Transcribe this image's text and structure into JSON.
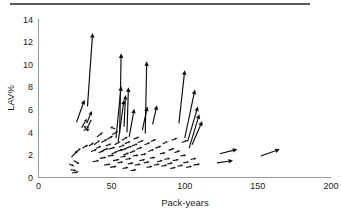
{
  "figure": {
    "background_color": "#ffffff",
    "ink_color": "#0d0d0d",
    "axis_color": "#9a9a9a",
    "top_rule_color": "#5a5a5a"
  },
  "axes": {
    "x_title": "Pack-years",
    "y_title": "LAV%",
    "x_ticks": [
      "0",
      "50",
      "100",
      "150",
      "200"
    ],
    "y_ticks": [
      "0",
      "2",
      "4",
      "6",
      "8",
      "10",
      "12",
      "14"
    ]
  },
  "chart_data": {
    "type": "scatter",
    "title": "",
    "xlabel": "Pack-years",
    "ylabel": "LAV%",
    "xlim": [
      0,
      200
    ],
    "ylim": [
      0,
      14
    ],
    "xticks": [
      0,
      50,
      100,
      150,
      200
    ],
    "yticks": [
      0,
      2,
      4,
      6,
      8,
      10,
      12,
      14
    ],
    "grid": false,
    "legend": "none",
    "marker": "arrow",
    "series": [
      {
        "name": "change-vectors",
        "units": {
          "x": "pack-years",
          "y": "LAV%"
        },
        "vectors": [
          {
            "x0": 21.0,
            "y0": 1.2,
            "x1": 24.5,
            "y1": 1.0
          },
          {
            "x0": 22.0,
            "y0": 0.7,
            "x1": 26.0,
            "y1": 0.6
          },
          {
            "x0": 23.0,
            "y0": 0.4,
            "x1": 27.5,
            "y1": 0.5
          },
          {
            "x0": 24.0,
            "y0": 1.5,
            "x1": 28.0,
            "y1": 1.2
          },
          {
            "x0": 22.5,
            "y0": 1.8,
            "x1": 27.0,
            "y1": 2.4
          },
          {
            "x0": 25.0,
            "y0": 2.2,
            "x1": 29.0,
            "y1": 2.6
          },
          {
            "x0": 26.0,
            "y0": 4.9,
            "x1": 31.5,
            "y1": 6.9
          },
          {
            "x0": 30.0,
            "y0": 2.6,
            "x1": 34.0,
            "y1": 2.9
          },
          {
            "x0": 29.5,
            "y0": 4.4,
            "x1": 33.0,
            "y1": 5.2
          },
          {
            "x0": 31.0,
            "y0": 4.2,
            "x1": 35.0,
            "y1": 4.3
          },
          {
            "x0": 33.0,
            "y0": 4.8,
            "x1": 36.5,
            "y1": 5.9
          },
          {
            "x0": 34.0,
            "y0": 4.1,
            "x1": 31.0,
            "y1": 4.6
          },
          {
            "x0": 36.0,
            "y0": 5.1,
            "x1": 33.0,
            "y1": 4.3
          },
          {
            "x0": 33.5,
            "y0": 6.3,
            "x1": 37.0,
            "y1": 12.8
          },
          {
            "x0": 34.5,
            "y0": 2.8,
            "x1": 38.0,
            "y1": 3.1
          },
          {
            "x0": 36.0,
            "y0": 2.3,
            "x1": 40.0,
            "y1": 2.5
          },
          {
            "x0": 37.0,
            "y0": 1.4,
            "x1": 41.5,
            "y1": 1.5
          },
          {
            "x0": 38.0,
            "y0": 2.9,
            "x1": 42.0,
            "y1": 3.3
          },
          {
            "x0": 39.5,
            "y0": 2.6,
            "x1": 43.0,
            "y1": 2.8
          },
          {
            "x0": 40.0,
            "y0": 3.6,
            "x1": 44.0,
            "y1": 4.0
          },
          {
            "x0": 41.0,
            "y0": 2.2,
            "x1": 45.0,
            "y1": 2.4
          },
          {
            "x0": 42.0,
            "y0": 1.7,
            "x1": 46.5,
            "y1": 1.8
          },
          {
            "x0": 43.0,
            "y0": 3.1,
            "x1": 47.0,
            "y1": 3.4
          },
          {
            "x0": 44.0,
            "y0": 2.4,
            "x1": 48.0,
            "y1": 2.6
          },
          {
            "x0": 45.0,
            "y0": 1.1,
            "x1": 49.5,
            "y1": 1.2
          },
          {
            "x0": 46.0,
            "y0": 2.8,
            "x1": 50.0,
            "y1": 3.0
          },
          {
            "x0": 47.0,
            "y0": 3.4,
            "x1": 51.0,
            "y1": 3.7
          },
          {
            "x0": 47.5,
            "y0": 1.9,
            "x1": 52.0,
            "y1": 2.0
          },
          {
            "x0": 48.0,
            "y0": 2.5,
            "x1": 52.5,
            "y1": 2.7
          },
          {
            "x0": 49.0,
            "y0": 0.9,
            "x1": 53.5,
            "y1": 1.0
          },
          {
            "x0": 50.0,
            "y0": 2.1,
            "x1": 54.0,
            "y1": 2.3
          },
          {
            "x0": 50.5,
            "y0": 3.8,
            "x1": 54.5,
            "y1": 4.1
          },
          {
            "x0": 51.0,
            "y0": 1.5,
            "x1": 55.5,
            "y1": 1.6
          },
          {
            "x0": 52.0,
            "y0": 2.9,
            "x1": 56.0,
            "y1": 3.2
          },
          {
            "x0": 52.5,
            "y0": 4.3,
            "x1": 49.0,
            "y1": 4.5
          },
          {
            "x0": 53.0,
            "y0": 3.5,
            "x1": 56.5,
            "y1": 8.1
          },
          {
            "x0": 53.5,
            "y0": 2.3,
            "x1": 57.5,
            "y1": 2.5
          },
          {
            "x0": 54.0,
            "y0": 1.3,
            "x1": 58.0,
            "y1": 1.4
          },
          {
            "x0": 54.5,
            "y0": 3.2,
            "x1": 58.5,
            "y1": 6.9
          },
          {
            "x0": 55.0,
            "y0": 2.7,
            "x1": 59.0,
            "y1": 2.9
          },
          {
            "x0": 55.5,
            "y0": 3.9,
            "x1": 56.5,
            "y1": 11.0
          },
          {
            "x0": 56.0,
            "y0": 1.8,
            "x1": 60.0,
            "y1": 1.9
          },
          {
            "x0": 56.5,
            "y0": 2.4,
            "x1": 60.5,
            "y1": 2.6
          },
          {
            "x0": 57.0,
            "y0": 3.3,
            "x1": 61.0,
            "y1": 3.6
          },
          {
            "x0": 57.5,
            "y0": 0.8,
            "x1": 61.5,
            "y1": 0.9
          },
          {
            "x0": 58.0,
            "y0": 2.0,
            "x1": 62.0,
            "y1": 2.2
          },
          {
            "x0": 58.5,
            "y0": 4.5,
            "x1": 59.5,
            "y1": 7.3
          },
          {
            "x0": 59.0,
            "y0": 3.0,
            "x1": 63.0,
            "y1": 3.2
          },
          {
            "x0": 59.5,
            "y0": 1.6,
            "x1": 63.5,
            "y1": 1.7
          },
          {
            "x0": 60.0,
            "y0": 2.6,
            "x1": 64.0,
            "y1": 2.8
          },
          {
            "x0": 60.5,
            "y0": 4.0,
            "x1": 61.5,
            "y1": 8.0
          },
          {
            "x0": 61.0,
            "y0": 1.2,
            "x1": 65.0,
            "y1": 1.3
          },
          {
            "x0": 62.0,
            "y0": 3.6,
            "x1": 65.5,
            "y1": 6.1
          },
          {
            "x0": 62.5,
            "y0": 2.2,
            "x1": 66.5,
            "y1": 2.4
          },
          {
            "x0": 63.0,
            "y0": 0.6,
            "x1": 67.0,
            "y1": 0.7
          },
          {
            "x0": 64.0,
            "y0": 2.8,
            "x1": 68.0,
            "y1": 3.0
          },
          {
            "x0": 64.5,
            "y0": 1.9,
            "x1": 68.5,
            "y1": 2.0
          },
          {
            "x0": 65.0,
            "y0": 3.4,
            "x1": 69.0,
            "y1": 3.6
          },
          {
            "x0": 66.0,
            "y0": 1.1,
            "x1": 70.0,
            "y1": 1.2
          },
          {
            "x0": 67.0,
            "y0": 2.5,
            "x1": 71.0,
            "y1": 2.7
          },
          {
            "x0": 68.0,
            "y0": 3.1,
            "x1": 72.0,
            "y1": 3.3
          },
          {
            "x0": 69.0,
            "y0": 1.5,
            "x1": 73.0,
            "y1": 1.6
          },
          {
            "x0": 70.0,
            "y0": 2.0,
            "x1": 74.0,
            "y1": 2.1
          },
          {
            "x0": 71.0,
            "y0": 4.2,
            "x1": 74.5,
            "y1": 6.3
          },
          {
            "x0": 72.0,
            "y0": 1.3,
            "x1": 76.0,
            "y1": 1.4
          },
          {
            "x0": 72.5,
            "y0": 2.9,
            "x1": 76.5,
            "y1": 3.1
          },
          {
            "x0": 73.0,
            "y0": 3.9,
            "x1": 74.0,
            "y1": 10.3
          },
          {
            "x0": 74.0,
            "y0": 0.9,
            "x1": 78.0,
            "y1": 1.0
          },
          {
            "x0": 75.0,
            "y0": 2.3,
            "x1": 79.0,
            "y1": 2.5
          },
          {
            "x0": 76.0,
            "y0": 1.7,
            "x1": 80.0,
            "y1": 1.8
          },
          {
            "x0": 77.0,
            "y0": 3.2,
            "x1": 80.5,
            "y1": 3.4
          },
          {
            "x0": 78.0,
            "y0": 4.7,
            "x1": 81.0,
            "y1": 6.4
          },
          {
            "x0": 79.0,
            "y0": 1.1,
            "x1": 83.0,
            "y1": 1.2
          },
          {
            "x0": 80.0,
            "y0": 2.6,
            "x1": 84.0,
            "y1": 2.8
          },
          {
            "x0": 81.0,
            "y0": 1.4,
            "x1": 85.0,
            "y1": 1.5
          },
          {
            "x0": 83.0,
            "y0": 2.1,
            "x1": 87.0,
            "y1": 2.2
          },
          {
            "x0": 84.0,
            "y0": 1.0,
            "x1": 88.0,
            "y1": 1.1
          },
          {
            "x0": 85.0,
            "y0": 3.0,
            "x1": 88.5,
            "y1": 3.2
          },
          {
            "x0": 86.0,
            "y0": 1.6,
            "x1": 90.0,
            "y1": 1.7
          },
          {
            "x0": 88.0,
            "y0": 1.2,
            "x1": 92.0,
            "y1": 1.3
          },
          {
            "x0": 89.0,
            "y0": 2.4,
            "x1": 93.0,
            "y1": 2.6
          },
          {
            "x0": 90.0,
            "y0": 0.8,
            "x1": 94.0,
            "y1": 0.9
          },
          {
            "x0": 91.0,
            "y0": 3.3,
            "x1": 95.0,
            "y1": 3.5
          },
          {
            "x0": 92.0,
            "y0": 1.5,
            "x1": 96.0,
            "y1": 1.6
          },
          {
            "x0": 93.0,
            "y0": 2.2,
            "x1": 97.0,
            "y1": 2.4
          },
          {
            "x0": 95.0,
            "y0": 1.0,
            "x1": 99.0,
            "y1": 1.1
          },
          {
            "x0": 96.0,
            "y0": 4.8,
            "x1": 100.0,
            "y1": 9.5
          },
          {
            "x0": 97.0,
            "y0": 1.9,
            "x1": 101.0,
            "y1": 2.0
          },
          {
            "x0": 98.0,
            "y0": 3.1,
            "x1": 102.0,
            "y1": 3.3
          },
          {
            "x0": 99.0,
            "y0": 1.3,
            "x1": 103.0,
            "y1": 1.4
          },
          {
            "x0": 100.0,
            "y0": 3.5,
            "x1": 107.0,
            "y1": 7.8
          },
          {
            "x0": 101.0,
            "y0": 0.9,
            "x1": 105.0,
            "y1": 1.0
          },
          {
            "x0": 102.0,
            "y0": 3.2,
            "x1": 109.0,
            "y1": 6.3
          },
          {
            "x0": 103.0,
            "y0": 2.6,
            "x1": 110.0,
            "y1": 5.6
          },
          {
            "x0": 104.0,
            "y0": 1.6,
            "x1": 108.0,
            "y1": 1.7
          },
          {
            "x0": 105.0,
            "y0": 2.9,
            "x1": 112.0,
            "y1": 5.0
          },
          {
            "x0": 106.0,
            "y0": 1.1,
            "x1": 110.5,
            "y1": 1.2
          },
          {
            "x0": 122.0,
            "y0": 1.3,
            "x1": 133.0,
            "y1": 1.5
          },
          {
            "x0": 124.0,
            "y0": 2.1,
            "x1": 136.0,
            "y1": 2.5
          },
          {
            "x0": 152.0,
            "y0": 1.9,
            "x1": 165.0,
            "y1": 2.5
          }
        ]
      }
    ]
  }
}
